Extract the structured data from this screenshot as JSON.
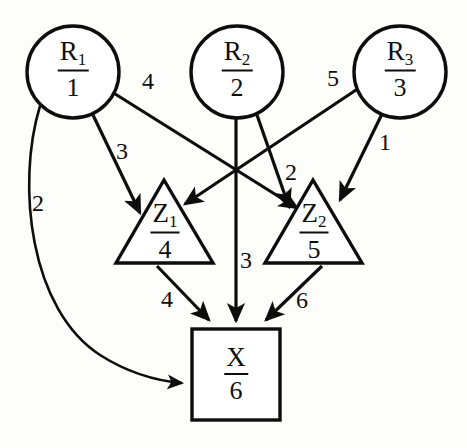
{
  "diagram": {
    "type": "directed-graph",
    "nodes": [
      {
        "id": "R1",
        "shape": "circle",
        "symbol": "R",
        "subscript": "1",
        "denominator": "1",
        "cx": 73,
        "cy": 72,
        "r": 46
      },
      {
        "id": "R2",
        "shape": "circle",
        "symbol": "R",
        "subscript": "2",
        "denominator": "2",
        "cx": 237,
        "cy": 72,
        "r": 46
      },
      {
        "id": "R3",
        "shape": "circle",
        "symbol": "R",
        "subscript": "3",
        "denominator": "3",
        "cx": 400,
        "cy": 72,
        "r": 46
      },
      {
        "id": "Z1",
        "shape": "triangle",
        "symbol": "Z",
        "subscript": "1",
        "denominator": "4",
        "cx": 165,
        "cy": 228
      },
      {
        "id": "Z2",
        "shape": "triangle",
        "symbol": "Z",
        "subscript": "2",
        "denominator": "5",
        "cx": 314,
        "cy": 228
      },
      {
        "id": "X",
        "shape": "square",
        "symbol": "X",
        "subscript": "",
        "denominator": "6",
        "cx": 236,
        "cy": 375
      }
    ],
    "edges": [
      {
        "id": "e-r1-z2",
        "from": "R1",
        "to": "Z2",
        "label": "4",
        "label_x": 148,
        "label_y": 81,
        "style": "straight"
      },
      {
        "id": "e-r1-z1",
        "from": "R1",
        "to": "Z1",
        "label": "3",
        "label_x": 122,
        "label_y": 151,
        "style": "straight"
      },
      {
        "id": "e-r1-x",
        "from": "R1",
        "to": "X",
        "label": "2",
        "label_x": 38,
        "label_y": 203,
        "style": "curved"
      },
      {
        "id": "e-r2-z2",
        "from": "R2",
        "to": "Z2",
        "label": "2",
        "label_x": 291,
        "label_y": 172,
        "style": "straight"
      },
      {
        "id": "e-r2-x",
        "from": "R2",
        "to": "X",
        "label": "3",
        "label_x": 246,
        "label_y": 260,
        "style": "straight"
      },
      {
        "id": "e-r3-z1",
        "from": "R3",
        "to": "Z1",
        "label": "5",
        "label_x": 333,
        "label_y": 78,
        "style": "straight"
      },
      {
        "id": "e-r3-z2",
        "from": "R3",
        "to": "Z2",
        "label": "1",
        "label_x": 385,
        "label_y": 142,
        "style": "straight"
      },
      {
        "id": "e-z1-x",
        "from": "Z1",
        "to": "X",
        "label": "4",
        "label_x": 167,
        "label_y": 299,
        "style": "straight"
      },
      {
        "id": "e-z2-x",
        "from": "Z2",
        "to": "X",
        "label": "6",
        "label_x": 302,
        "label_y": 300,
        "style": "straight"
      }
    ],
    "colors": {
      "stroke": "#0d0d0d",
      "fill": "#ffffff",
      "background": "#fdfdfc"
    }
  }
}
